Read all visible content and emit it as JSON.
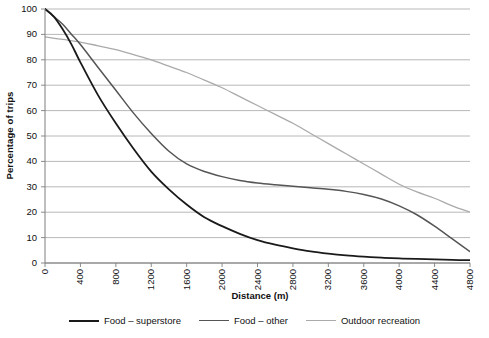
{
  "chart_data": {
    "type": "line",
    "title": "",
    "xlabel": "Distance (m)",
    "ylabel": "Percentage of trips",
    "xlim": [
      0,
      4800
    ],
    "ylim": [
      0,
      100
    ],
    "xticks": [
      0,
      400,
      800,
      1200,
      1600,
      2000,
      2400,
      2800,
      3200,
      3600,
      4000,
      4400,
      4800
    ],
    "yticks": [
      0,
      10,
      20,
      30,
      40,
      50,
      60,
      70,
      80,
      90,
      100
    ],
    "grid": "horizontal",
    "legend_position": "bottom",
    "series": [
      {
        "name": "Food – superstore",
        "color": "#1a1a1a",
        "width": 1.8,
        "x": [
          0,
          100,
          200,
          300,
          400,
          600,
          800,
          1000,
          1200,
          1400,
          1600,
          1800,
          2000,
          2200,
          2400,
          2600,
          2800,
          3000,
          3200,
          3400,
          3600,
          3800,
          4000,
          4200,
          4400,
          4600,
          4800
        ],
        "y": [
          100,
          97,
          92,
          86,
          79,
          66,
          55,
          45,
          36,
          29,
          23,
          18,
          14.5,
          11.5,
          9,
          7.2,
          5.8,
          4.6,
          3.7,
          3.0,
          2.5,
          2.1,
          1.8,
          1.6,
          1.4,
          1.2,
          1.1
        ]
      },
      {
        "name": "Food – other",
        "color": "#555555",
        "width": 1.5,
        "x": [
          0,
          100,
          200,
          300,
          400,
          600,
          800,
          1000,
          1200,
          1400,
          1600,
          1800,
          2000,
          2200,
          2400,
          2600,
          2800,
          3000,
          3200,
          3400,
          3600,
          3800,
          4000,
          4200,
          4400,
          4600,
          4800
        ],
        "y": [
          100,
          97,
          94,
          90,
          86,
          77,
          68,
          59,
          51,
          44,
          39,
          36,
          34,
          32.5,
          31.5,
          30.8,
          30.2,
          29.6,
          29,
          28.2,
          27,
          25.2,
          22.5,
          19,
          14.5,
          9.5,
          4.5
        ]
      },
      {
        "name": "Outdoor recreation",
        "color": "#aaaaaa",
        "width": 1.3,
        "x": [
          0,
          200,
          400,
          600,
          800,
          1000,
          1200,
          1400,
          1600,
          1800,
          2000,
          2200,
          2400,
          2600,
          2800,
          3000,
          3200,
          3400,
          3600,
          3800,
          4000,
          4200,
          4400,
          4600,
          4800
        ],
        "y": [
          89,
          88,
          87,
          85.5,
          84,
          82,
          80,
          77.5,
          75,
          72,
          69,
          65.5,
          62,
          58.5,
          55,
          51,
          47,
          43,
          39,
          35,
          31,
          28,
          25.5,
          22.5,
          20
        ]
      }
    ]
  },
  "axes": {
    "ytick_labels": [
      "100",
      "90",
      "80",
      "70",
      "60",
      "50",
      "40",
      "30",
      "20",
      "10",
      "0"
    ],
    "xtick_labels": [
      "0",
      "400",
      "800",
      "1200",
      "1600",
      "2000",
      "2400",
      "2800",
      "3200",
      "3600",
      "4000",
      "4400",
      "4800"
    ],
    "x_title": "Distance (m)",
    "y_title": "Percentage of trips"
  },
  "legend": {
    "items": [
      {
        "label": "Food – superstore",
        "color": "#1a1a1a",
        "thickness": "2px"
      },
      {
        "label": "Food – other",
        "color": "#555555",
        "thickness": "1.6px"
      },
      {
        "label": "Outdoor recreation",
        "color": "#aaaaaa",
        "thickness": "1.3px"
      }
    ]
  },
  "style": {
    "grid_color": "#a6a6a6",
    "axis_color": "#7f7f7f",
    "background": "#ffffff"
  }
}
